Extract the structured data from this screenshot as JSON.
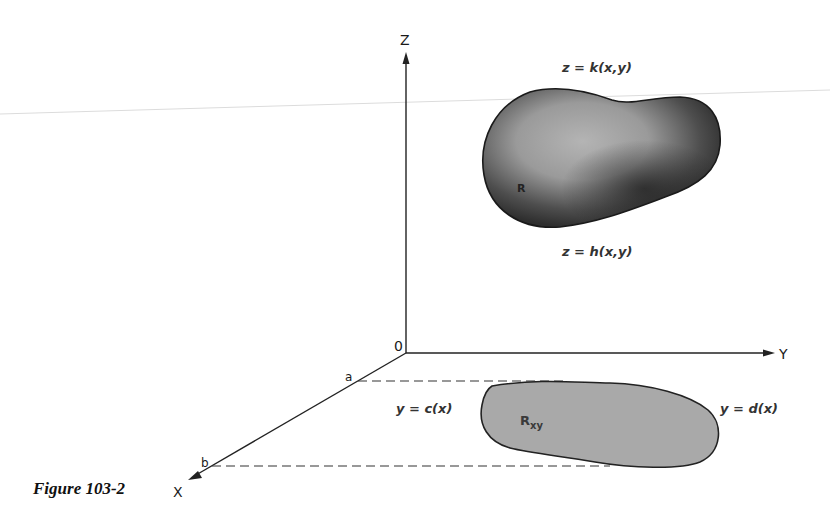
{
  "figure": {
    "caption": "Figure 103-2",
    "axes": {
      "z_label": "Z",
      "y_label": "Y",
      "x_label": "X",
      "origin_label": "0"
    },
    "points": {
      "a_label": "a",
      "b_label": "b"
    },
    "solid": {
      "label": "R",
      "top_surface": "z = k(x,y)",
      "bottom_surface": "z = h(x,y)",
      "fill_dark": "#3a3a3a",
      "fill_light": "#a8a8a8"
    },
    "projection": {
      "label_main": "R",
      "label_sub": "xy",
      "left_boundary": "y = c(x)",
      "right_boundary": "y = d(x)",
      "fill": "#a9a9a9"
    }
  }
}
